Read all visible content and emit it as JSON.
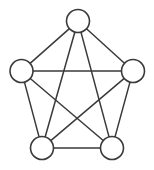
{
  "figure": {
    "background_color": "#ffffff",
    "stroke_color": "#3a3a3a",
    "node_fill_color": "#ffffff",
    "node_radius": 11.5,
    "edge_width": 1.5,
    "node_stroke_width": 1.6,
    "width": 154,
    "height": 170
  },
  "chart_data": {
    "type": "diagram",
    "diagram_type": "graph",
    "node_count": 5,
    "edge_count": 10,
    "layout": "pentagon",
    "nodes": [
      {
        "id": "top",
        "label": "",
        "cx": 78,
        "cy": 21,
        "r": 11.5
      },
      {
        "id": "left",
        "label": "",
        "cx": 21.5,
        "cy": 71,
        "r": 11.5
      },
      {
        "id": "right",
        "label": "",
        "cx": 133,
        "cy": 71,
        "r": 11.5
      },
      {
        "id": "bottom-left",
        "label": "",
        "cx": 42,
        "cy": 148,
        "r": 11.5
      },
      {
        "id": "bottom-right",
        "label": "",
        "cx": 112,
        "cy": 148,
        "r": 11.5
      }
    ],
    "edges": [
      {
        "from": "top",
        "to": "left",
        "kind": "perimeter"
      },
      {
        "from": "top",
        "to": "right",
        "kind": "perimeter"
      },
      {
        "from": "left",
        "to": "bottom-left",
        "kind": "perimeter"
      },
      {
        "from": "right",
        "to": "bottom-right",
        "kind": "perimeter"
      },
      {
        "from": "bottom-left",
        "to": "bottom-right",
        "kind": "perimeter"
      },
      {
        "from": "top",
        "to": "bottom-left",
        "kind": "diagonal"
      },
      {
        "from": "top",
        "to": "bottom-right",
        "kind": "diagonal"
      },
      {
        "from": "left",
        "to": "right",
        "kind": "diagonal"
      },
      {
        "from": "left",
        "to": "bottom-right",
        "kind": "diagonal"
      },
      {
        "from": "right",
        "to": "bottom-left",
        "kind": "diagonal"
      }
    ]
  }
}
